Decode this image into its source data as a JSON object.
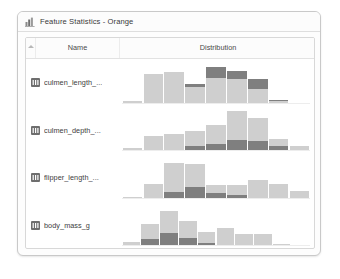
{
  "window": {
    "title": "Feature Statistics - Orange",
    "title_icon": "bar-chart-icon"
  },
  "table": {
    "headers": {
      "corner": "",
      "name": "Name",
      "distribution": "Distribution"
    },
    "sort_indicator": "sort-ascending-icon",
    "row_icon": "numeric-variable-icon",
    "rows": [
      {
        "name": "culmen_length_..."
      },
      {
        "name": "culmen_depth_..."
      },
      {
        "name": "flipper_length_..."
      },
      {
        "name": "body_mass_g"
      }
    ]
  },
  "colors": {
    "light_bar": "#cfcfcf",
    "dark_bar": "#7f7f7f",
    "window_border": "#c9c9c9",
    "header_text": "#4a4a4a",
    "title_text": "#3a3a3a",
    "baseline": "#ededed"
  },
  "chart_data": [
    {
      "type": "bar",
      "title": "culmen_length_mm",
      "xlabel": "",
      "ylabel": "",
      "stacked": true,
      "grid": false,
      "legend": "none",
      "series": [
        {
          "name": "light",
          "values": [
            7,
            72,
            76,
            40,
            62,
            58,
            34,
            5,
            2
          ]
        },
        {
          "name": "dark",
          "values": [
            0,
            0,
            0,
            6,
            26,
            20,
            24,
            3,
            0
          ]
        }
      ],
      "categories": [
        "b1",
        "b2",
        "b3",
        "b4",
        "b5",
        "b6",
        "b7",
        "b8",
        "b9"
      ],
      "ylim": [
        0,
        100
      ]
    },
    {
      "type": "bar",
      "title": "culmen_depth_mm",
      "xlabel": "",
      "ylabel": "",
      "stacked": true,
      "grid": false,
      "legend": "none",
      "series": [
        {
          "name": "light",
          "values": [
            8,
            40,
            44,
            42,
            50,
            78,
            62,
            18,
            8
          ]
        },
        {
          "name": "dark",
          "values": [
            0,
            0,
            0,
            12,
            18,
            28,
            26,
            14,
            4
          ]
        }
      ],
      "categories": [
        "b1",
        "b2",
        "b3",
        "b4",
        "b5",
        "b6",
        "b7",
        "b8",
        "b9"
      ],
      "ylim": [
        0,
        110
      ]
    },
    {
      "type": "bar",
      "title": "flipper_length_mm",
      "xlabel": "",
      "ylabel": "",
      "stacked": true,
      "grid": false,
      "legend": "none",
      "series": [
        {
          "name": "light",
          "values": [
            4,
            36,
            78,
            62,
            22,
            28,
            48,
            38,
            20
          ]
        },
        {
          "name": "dark",
          "values": [
            0,
            2,
            16,
            30,
            14,
            8,
            2,
            0,
            0
          ]
        }
      ],
      "categories": [
        "b1",
        "b2",
        "b3",
        "b4",
        "b5",
        "b6",
        "b7",
        "b8",
        "b9"
      ],
      "ylim": [
        0,
        110
      ]
    },
    {
      "type": "bar",
      "title": "body_mass_g",
      "xlabel": "",
      "ylabel": "",
      "stacked": true,
      "grid": false,
      "legend": "none",
      "series": [
        {
          "name": "light",
          "values": [
            10,
            40,
            58,
            44,
            28,
            48,
            32,
            32,
            6,
            2
          ]
        },
        {
          "name": "dark",
          "values": [
            0,
            18,
            34,
            22,
            8,
            0,
            0,
            0,
            0,
            0
          ]
        }
      ],
      "categories": [
        "b1",
        "b2",
        "b3",
        "b4",
        "b5",
        "b6",
        "b7",
        "b8",
        "b9",
        "b10"
      ],
      "ylim": [
        0,
        110
      ]
    }
  ]
}
